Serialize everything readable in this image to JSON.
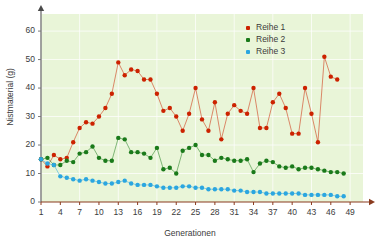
{
  "chart_data": {
    "type": "line",
    "title": "",
    "xlabel": "Generationen",
    "ylabel": "Nistmaterial (g)",
    "xlim": [
      1,
      51
    ],
    "ylim": [
      0,
      66
    ],
    "yticks": [
      0,
      10,
      20,
      30,
      40,
      50,
      60
    ],
    "xticks": [
      1,
      4,
      7,
      10,
      13,
      16,
      19,
      22,
      25,
      28,
      31,
      34,
      37,
      40,
      43,
      46,
      49
    ],
    "grid": true,
    "legend_position": "top-right",
    "background_color": "#e9f5d8",
    "x": [
      1,
      2,
      3,
      4,
      5,
      6,
      7,
      8,
      9,
      10,
      11,
      12,
      13,
      14,
      15,
      16,
      17,
      18,
      19,
      20,
      21,
      22,
      23,
      24,
      25,
      26,
      27,
      28,
      29,
      30,
      31,
      32,
      33,
      34,
      35,
      36,
      37,
      38,
      39,
      40,
      41,
      42,
      43,
      44,
      45,
      46,
      47,
      48,
      49,
      50,
      51
    ],
    "series": [
      {
        "name": "Reihe 1",
        "color": "#cc2200",
        "values": [
          15,
          12.5,
          16.5,
          15,
          15.5,
          21,
          26,
          28,
          27.5,
          30,
          33,
          38,
          49,
          44.5,
          46.5,
          46,
          43,
          43,
          38,
          32,
          33,
          30,
          25,
          31,
          40,
          29,
          25,
          35,
          22,
          31,
          34,
          32,
          31,
          40,
          26,
          26,
          35,
          38,
          33,
          24,
          24,
          40,
          31,
          21,
          51,
          44,
          43,
          0,
          0,
          0,
          0
        ]
      },
      {
        "name": "Reihe 2",
        "color": "#1a7a1a",
        "values": [
          15,
          15.5,
          13,
          13,
          14.5,
          14,
          17,
          17.5,
          19.5,
          15.5,
          14.5,
          14.5,
          22.5,
          22,
          17.5,
          17.5,
          17,
          15.5,
          19,
          11.5,
          12,
          10,
          18,
          19,
          20,
          16.5,
          16.5,
          14.5,
          15.5,
          15,
          14.5,
          14.5,
          15,
          10.5,
          13.5,
          14.5,
          14,
          12.5,
          12,
          12.5,
          11.5,
          12,
          12,
          11.5,
          11,
          10.5,
          10.5,
          10,
          0,
          0,
          0
        ]
      },
      {
        "name": "Reihe 3",
        "color": "#2ba6e0",
        "values": [
          15,
          13.5,
          13,
          9,
          8.5,
          8,
          7.5,
          8,
          7.5,
          7,
          6.5,
          6.5,
          7,
          7.5,
          6.5,
          6,
          6,
          6,
          5.5,
          5,
          5,
          5,
          5.5,
          5.5,
          5,
          5,
          4.5,
          4.5,
          4.5,
          4.5,
          4,
          4,
          3.5,
          3.5,
          3.5,
          3,
          3,
          3,
          3,
          3,
          3,
          2.5,
          2.5,
          2.5,
          2.5,
          2.5,
          2,
          2,
          0,
          0,
          0
        ]
      }
    ]
  },
  "legend": {
    "items": [
      {
        "label": "Reihe 1"
      },
      {
        "label": "Reihe 2"
      },
      {
        "label": "Reihe 3"
      }
    ]
  },
  "axis_titles": {
    "y": "Nistmaterial (g)",
    "x": "Generationen"
  }
}
